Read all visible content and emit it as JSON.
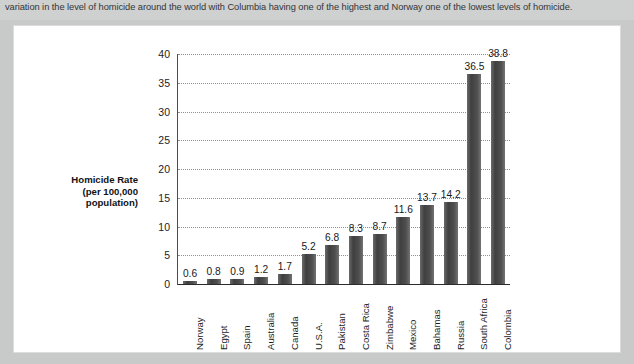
{
  "caption": {
    "text": "variation in the level of homicide around the world with Columbia having one of the highest and Norway one of the lowest levels of homicide."
  },
  "chart_data": {
    "type": "bar",
    "title": "",
    "subtitle": "",
    "xlabel": "",
    "ylabel": "Homicide Rate (per 100,000 population)",
    "ylabel_lines": [
      "Homicide Rate",
      "(per 100,000",
      "population)"
    ],
    "categories": [
      "Norway",
      "Egypt",
      "Spain",
      "Australia",
      "Canada",
      "U.S.A.",
      "Pakistan",
      "Costa Rica",
      "Zimbabwe",
      "Mexico",
      "Bahamas",
      "Russia",
      "South Africa",
      "Colombia"
    ],
    "values": [
      0.6,
      0.8,
      0.9,
      1.2,
      1.7,
      5.2,
      6.8,
      8.3,
      8.7,
      11.6,
      13.7,
      14.2,
      36.5,
      38.8
    ],
    "value_labels": [
      "0.6",
      "0.8",
      "0.9",
      "1.2",
      "1.7",
      "5.2",
      "6.8",
      "8.3",
      "8.7",
      "11.6",
      "13.7",
      "14.2",
      "36.5",
      "38.8"
    ],
    "ylim": [
      0,
      40
    ],
    "ytick_values": [
      0,
      5,
      10,
      15,
      20,
      25,
      30,
      35,
      40
    ],
    "ytick_labels": [
      "0",
      "5",
      "10",
      "15",
      "20",
      "25",
      "30",
      "35",
      "40"
    ],
    "grid": true,
    "grid_style": "dotted",
    "legend": "none",
    "bar_color": "#4d4d4d",
    "axis_color": "#2b2b2b",
    "gridline_color": "#8d8f91",
    "panel_background": "#ffffff",
    "page_background": "#c8c9c9"
  }
}
